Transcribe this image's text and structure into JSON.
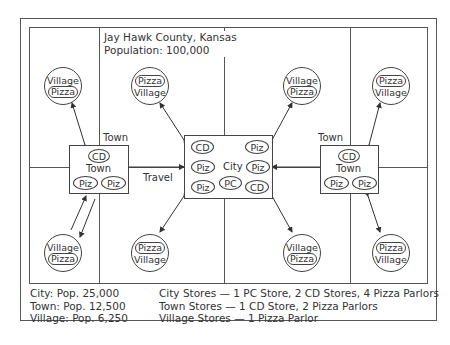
{
  "map": {
    "title_line1": "Jay Hawk County, Kansas",
    "title_line2": "Population: 100,000"
  },
  "city": {
    "label": "City",
    "stores": [
      "CD",
      "Piz",
      "Piz",
      "Piz",
      "Piz",
      "PC",
      "CD"
    ]
  },
  "towns": [
    {
      "outer_label": "Town",
      "inner_label": "Town",
      "stores": [
        "CD",
        "Piz",
        "Piz"
      ]
    },
    {
      "outer_label": "Town",
      "inner_label": "Town",
      "stores": [
        "CD",
        "Piz",
        "Piz"
      ]
    }
  ],
  "travel_label": "Travel",
  "villages": [
    {
      "line1": "Village",
      "line2": "Pizza",
      "pill": 2
    },
    {
      "line1": "Pizza",
      "line2": "Village",
      "pill": 1
    },
    {
      "line1": "Village",
      "line2": "Pizza",
      "pill": 2
    },
    {
      "line1": "Pizza",
      "line2": "Village",
      "pill": 1
    },
    {
      "line1": "Village",
      "line2": "Pizza",
      "pill": 2
    },
    {
      "line1": "Pizza",
      "line2": "Village",
      "pill": 1
    },
    {
      "line1": "Village",
      "line2": "Pizza",
      "pill": 2
    },
    {
      "line1": "Pizza",
      "line2": "Village",
      "pill": 1
    }
  ],
  "legend": {
    "populations": [
      "City: Pop. 25,000",
      "Town: Pop. 12,500",
      "Village: Pop. 6,250"
    ],
    "stores": [
      "City Stores — 1 PC Store, 2 CD Stores, 4 Pizza Parlors",
      "Town Stores — 1 CD Store, 2 Pizza Parlors",
      "Village Stores — 1 Pizza Parlor"
    ]
  }
}
